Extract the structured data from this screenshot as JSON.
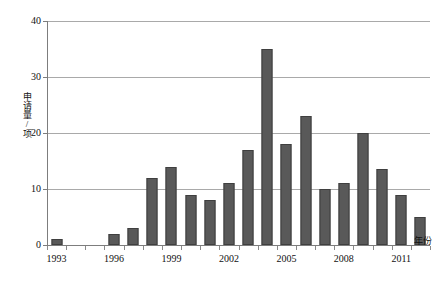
{
  "chart_data": {
    "type": "bar",
    "title": "",
    "subtitle": "",
    "xlabel": "年份",
    "ylabel": "申请量/项",
    "categories": [
      "1993",
      "1994",
      "1995",
      "1996",
      "1997",
      "1998",
      "1999",
      "2000",
      "2001",
      "2002",
      "2003",
      "2004",
      "2005",
      "2006",
      "2007",
      "2008",
      "2009",
      "2010",
      "2011",
      "2012"
    ],
    "values": [
      1,
      0,
      0,
      2,
      3,
      12,
      14,
      9,
      8,
      11,
      17,
      35,
      18,
      23,
      10,
      11,
      20,
      13.5,
      9,
      5
    ],
    "series": [
      {
        "name": "申请量/项",
        "values": [
          1,
          0,
          0,
          2,
          3,
          12,
          14,
          9,
          8,
          11,
          17,
          35,
          18,
          23,
          10,
          11,
          20,
          13.5,
          9,
          5
        ]
      }
    ],
    "ylim": [
      0,
      40
    ],
    "y_ticks": [
      0,
      10,
      20,
      30,
      40
    ],
    "y_tick_labels": [
      "0",
      "10",
      "20",
      "30",
      "40"
    ],
    "x_tick_labels": [
      "1993",
      "1996",
      "1999",
      "2002",
      "2005",
      "2008",
      "2011"
    ],
    "x_tick_categories": [
      "1993",
      "1996",
      "1999",
      "2002",
      "2005",
      "2008",
      "2011"
    ],
    "grid": "horizontal",
    "legend": "none",
    "bar_color": "#595959",
    "gridline_color": "#a9a9a9",
    "axis_color": "#7d7d7d",
    "background_color": "#ffffff"
  }
}
